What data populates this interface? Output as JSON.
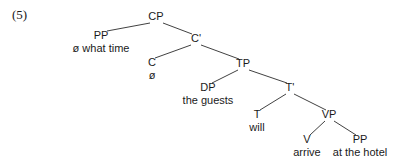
{
  "figure": {
    "example_number": "(5)",
    "caption": "",
    "background_color": "#ffffff",
    "line_color": "#2b2b2b",
    "text_color": "#1a1a1a"
  },
  "tree": {
    "type": "constituency-syntax-tree",
    "sentence": "ø what time ø the guests will arrive at the hotel",
    "nodes": [
      {
        "id": "cp",
        "label": "CP",
        "x": 156,
        "y": 20,
        "kind": "phrase"
      },
      {
        "id": "pp1",
        "label": "PP",
        "x": 101,
        "y": 39,
        "kind": "phrase"
      },
      {
        "id": "pp1_term",
        "label": "ø what time",
        "x": 101,
        "y": 52,
        "kind": "terminal"
      },
      {
        "id": "cbar",
        "label": "C'",
        "x": 196,
        "y": 42,
        "kind": "bar"
      },
      {
        "id": "c",
        "label": "C",
        "x": 152,
        "y": 66,
        "kind": "head"
      },
      {
        "id": "c_term",
        "label": "ø",
        "x": 152,
        "y": 79,
        "kind": "terminal"
      },
      {
        "id": "tp",
        "label": "TP",
        "x": 243,
        "y": 67,
        "kind": "phrase"
      },
      {
        "id": "dp",
        "label": "DP",
        "x": 208,
        "y": 91,
        "kind": "phrase"
      },
      {
        "id": "dp_term",
        "label": "the guests",
        "x": 208,
        "y": 104,
        "kind": "terminal"
      },
      {
        "id": "tbar",
        "label": "T'",
        "x": 290,
        "y": 91,
        "kind": "bar"
      },
      {
        "id": "t",
        "label": "T",
        "x": 257,
        "y": 118,
        "kind": "head"
      },
      {
        "id": "t_term",
        "label": "will",
        "x": 257,
        "y": 131,
        "kind": "terminal"
      },
      {
        "id": "vp",
        "label": "VP",
        "x": 329,
        "y": 118,
        "kind": "phrase"
      },
      {
        "id": "v",
        "label": "V",
        "x": 307,
        "y": 143,
        "kind": "head"
      },
      {
        "id": "v_term",
        "label": "arrive",
        "x": 307,
        "y": 156,
        "kind": "terminal"
      },
      {
        "id": "pp2",
        "label": "PP",
        "x": 360,
        "y": 143,
        "kind": "phrase"
      },
      {
        "id": "pp2_term",
        "label": "at the hotel",
        "x": 360,
        "y": 156,
        "kind": "terminal"
      }
    ],
    "edges": [
      {
        "id": "cp-pp1",
        "from": "CP",
        "to": "PP",
        "x1": 150,
        "y1": 23,
        "x2": 107,
        "y2": 31
      },
      {
        "id": "cp-cbar",
        "from": "CP",
        "to": "C'",
        "x1": 163,
        "y1": 23,
        "x2": 192,
        "y2": 34
      },
      {
        "id": "cbar-c",
        "from": "C'",
        "to": "C",
        "x1": 191,
        "y1": 45,
        "x2": 155,
        "y2": 58
      },
      {
        "id": "cbar-tp",
        "from": "C'",
        "to": "TP",
        "x1": 201,
        "y1": 45,
        "x2": 239,
        "y2": 59
      },
      {
        "id": "tp-dp",
        "from": "TP",
        "to": "DP",
        "x1": 238,
        "y1": 70,
        "x2": 212,
        "y2": 83
      },
      {
        "id": "tp-tbar",
        "from": "TP",
        "to": "T'",
        "x1": 249,
        "y1": 70,
        "x2": 287,
        "y2": 83
      },
      {
        "id": "tbar-t",
        "from": "T'",
        "to": "T",
        "x1": 286,
        "y1": 94,
        "x2": 260,
        "y2": 110
      },
      {
        "id": "tbar-vp",
        "from": "T'",
        "to": "VP",
        "x1": 294,
        "y1": 94,
        "x2": 326,
        "y2": 110
      },
      {
        "id": "vp-v",
        "from": "VP",
        "to": "V",
        "x1": 325,
        "y1": 121,
        "x2": 310,
        "y2": 135
      },
      {
        "id": "vp-pp2",
        "from": "VP",
        "to": "PP",
        "x1": 334,
        "y1": 121,
        "x2": 356,
        "y2": 135
      }
    ]
  }
}
